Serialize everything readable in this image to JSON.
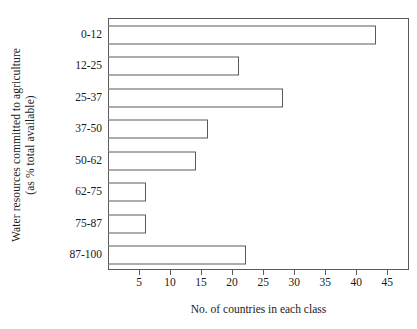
{
  "chart_data": {
    "type": "bar",
    "orientation": "horizontal",
    "title": "",
    "xlabel": "No. of countries in each class",
    "ylabel": "Water resources committed to agriculture (as % total available)",
    "ylabel_lines": [
      "Water resources committed to agriculture",
      "(as % total available)"
    ],
    "categories": [
      "0-12",
      "12-25",
      "25-37",
      "37-50",
      "50-62",
      "62-75",
      "75-87",
      "87-100"
    ],
    "values": [
      43,
      21,
      28,
      16,
      14,
      6,
      6,
      22
    ],
    "xlim": [
      0,
      48.5
    ],
    "ylim": [
      0,
      8
    ],
    "xticks": [
      5,
      10,
      15,
      20,
      25,
      30,
      35,
      40,
      45
    ],
    "xticklabels": [
      "5",
      "10",
      "15",
      "20",
      "25",
      "30",
      "35",
      "40",
      "45"
    ],
    "grid": false,
    "legend": false,
    "legend_position": "none",
    "bar_facecolor": "#ffffff",
    "bar_edgecolor": "#5a5a5a",
    "axes_color": "#5a5a5a",
    "background": "#ffffff"
  }
}
